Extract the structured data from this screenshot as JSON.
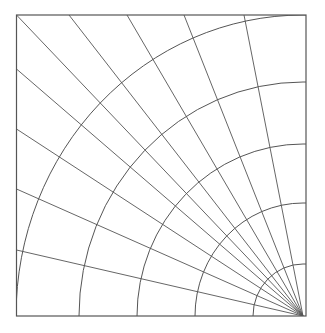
{
  "diagram": {
    "type": "polar-grid-quadrant",
    "background": "#ffffff",
    "stroke_color": "#555555",
    "frame": {
      "left": 16.5,
      "top": 15,
      "right": 306,
      "bottom": 316
    },
    "center": {
      "x": 303,
      "y": 316
    },
    "arcs": [
      {
        "rx": 50,
        "ry": 52
      },
      {
        "rx": 108,
        "ry": 113
      },
      {
        "rx": 166,
        "ry": 172
      },
      {
        "rx": 224,
        "ry": 234
      },
      {
        "rx": 287,
        "ry": 301
      }
    ],
    "rays": [
      {
        "x": 16.5,
        "y": 15
      },
      {
        "x": 69,
        "y": 15
      },
      {
        "x": 127,
        "y": 15
      },
      {
        "x": 184,
        "y": 15
      },
      {
        "x": 244,
        "y": 15
      },
      {
        "x": 16.5,
        "y": 69
      },
      {
        "x": 16.5,
        "y": 129
      },
      {
        "x": 16.5,
        "y": 189
      },
      {
        "x": 16.5,
        "y": 250
      }
    ]
  }
}
